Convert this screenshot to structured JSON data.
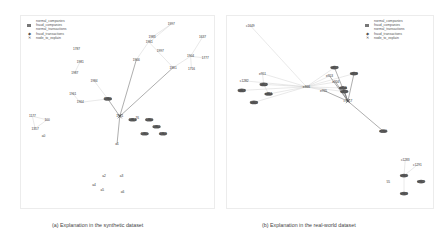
{
  "legend": {
    "items": [
      {
        "label": "normal_companies",
        "icon": "none"
      },
      {
        "label": "fraud_companies",
        "icon": "square"
      },
      {
        "label": "normal_transactions",
        "icon": "none"
      },
      {
        "label": "fraud_transactions",
        "icon": "diamond"
      },
      {
        "label": "node_to_explain",
        "icon": "cross"
      }
    ]
  },
  "panels": [
    {
      "caption": "(a) Explanation in the synthetic dataset",
      "nodes": [
        {
          "id": "a0",
          "label": "1787",
          "type": "normal_company"
        },
        {
          "id": "a1",
          "label": "1997",
          "type": "normal_transaction"
        },
        {
          "id": "a2",
          "label": "1983",
          "type": "normal_transaction"
        },
        {
          "id": "a3",
          "label": "1966",
          "type": "normal_transaction"
        },
        {
          "id": "a4",
          "label": "1961",
          "type": "normal_transaction"
        },
        {
          "id": "a5",
          "label": "1997",
          "type": "normal_transaction"
        },
        {
          "id": "a6",
          "label": "1637",
          "type": "normal_company"
        },
        {
          "id": "a7",
          "label": "1904",
          "type": "normal_transaction"
        },
        {
          "id": "a8",
          "label": "1777",
          "type": "normal_company"
        },
        {
          "id": "a9",
          "label": "1716",
          "type": "normal_company"
        },
        {
          "id": "a10",
          "label": "1981",
          "type": "normal_transaction"
        },
        {
          "id": "a11",
          "label": "1981",
          "type": "normal_transaction"
        },
        {
          "id": "a12",
          "label": "1987",
          "type": "normal_transaction"
        },
        {
          "id": "a13",
          "label": "1984",
          "type": "normal_transaction"
        },
        {
          "id": "a14",
          "label": "1961",
          "type": "normal_transaction"
        },
        {
          "id": "a15",
          "label": "1964",
          "type": "normal_transaction"
        },
        {
          "id": "a16",
          "label": "1961",
          "type": "node_to_explain"
        },
        {
          "id": "a17",
          "label": "1980",
          "type": "fraud_transaction"
        },
        {
          "id": "a18",
          "label": "1963",
          "type": "fraud_transaction"
        },
        {
          "id": "a19",
          "label": "1960",
          "type": "fraud_transaction"
        },
        {
          "id": "a20",
          "label": "1962",
          "type": "fraud_transaction"
        },
        {
          "id": "a21",
          "label": "1965",
          "type": "fraud_transaction"
        },
        {
          "id": "a22",
          "label": "1967",
          "type": "fraud_transaction"
        },
        {
          "id": "a23",
          "label": "76",
          "type": "normal_company"
        },
        {
          "id": "a24",
          "label": "1177",
          "type": "normal_company"
        },
        {
          "id": "a25",
          "label": "100",
          "type": "normal_company"
        },
        {
          "id": "a26",
          "label": "1357",
          "type": "normal_company"
        },
        {
          "id": "a27",
          "label": "a0",
          "type": "normal_company"
        },
        {
          "id": "a28",
          "label": "a1",
          "type": "normal_company"
        },
        {
          "id": "a29",
          "label": "a2",
          "type": "normal_company"
        },
        {
          "id": "a30",
          "label": "a3",
          "type": "normal_company"
        },
        {
          "id": "a31",
          "label": "a4",
          "type": "normal_company"
        },
        {
          "id": "a32",
          "label": "a5",
          "type": "normal_company"
        },
        {
          "id": "a33",
          "label": "a6",
          "type": "normal_company"
        }
      ]
    },
    {
      "caption": "(b) Explanation in the real-world dataset",
      "nodes": [
        {
          "id": "b0",
          "label": "c1649",
          "type": "normal_company"
        },
        {
          "id": "b1",
          "label": "e951",
          "type": "normal_transaction"
        },
        {
          "id": "b2",
          "label": "c1282",
          "type": "normal_company"
        },
        {
          "id": "b3",
          "label": "e852",
          "type": "fraud_transaction"
        },
        {
          "id": "b4",
          "label": "e863",
          "type": "fraud_transaction"
        },
        {
          "id": "b5",
          "label": "e864",
          "type": "fraud_transaction"
        },
        {
          "id": "b6",
          "label": "e865",
          "type": "fraud_transaction"
        },
        {
          "id": "b7",
          "label": "e866",
          "type": "normal_transaction"
        },
        {
          "id": "b8",
          "label": "e854",
          "type": "fraud_transaction"
        },
        {
          "id": "b9",
          "label": "e955",
          "type": "normal_transaction"
        },
        {
          "id": "b10",
          "label": "e953",
          "type": "normal_transaction"
        },
        {
          "id": "b11",
          "label": "e857",
          "type": "fraud_transaction"
        },
        {
          "id": "b12",
          "label": "e956",
          "type": "normal_transaction"
        },
        {
          "id": "b13",
          "label": "e858",
          "type": "fraud_transaction"
        },
        {
          "id": "b14",
          "label": "e859",
          "type": "fraud_transaction"
        },
        {
          "id": "b15",
          "label": "c1617",
          "type": "node_to_explain"
        },
        {
          "id": "b16",
          "label": "e960",
          "type": "fraud_transaction"
        },
        {
          "id": "b17",
          "label": "c1283",
          "type": "normal_company"
        },
        {
          "id": "b18",
          "label": "c1291",
          "type": "normal_company"
        },
        {
          "id": "b19",
          "label": "e961",
          "type": "fraud_transaction"
        },
        {
          "id": "b20",
          "label": "55",
          "type": "normal_company"
        },
        {
          "id": "b21",
          "label": "e962",
          "type": "fraud_transaction"
        },
        {
          "id": "b22",
          "label": "e963",
          "type": "fraud_transaction"
        }
      ]
    }
  ]
}
